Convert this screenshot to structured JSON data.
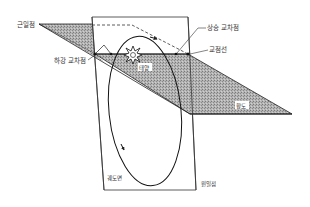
{
  "diagram": {
    "type": "orbital-elements",
    "labels": {
      "perihelion": "근일점",
      "ascending_node": "상승 교차점",
      "line_of_nodes": "교점선",
      "descending_node": "하강 교차점",
      "sun": "태양",
      "ecliptic": "황도",
      "orbital_plane": "궤도면",
      "aphelion": "원일점"
    },
    "colors": {
      "plane_fill": "#a8a8a8",
      "line": "#222222",
      "background": "#ffffff"
    }
  }
}
